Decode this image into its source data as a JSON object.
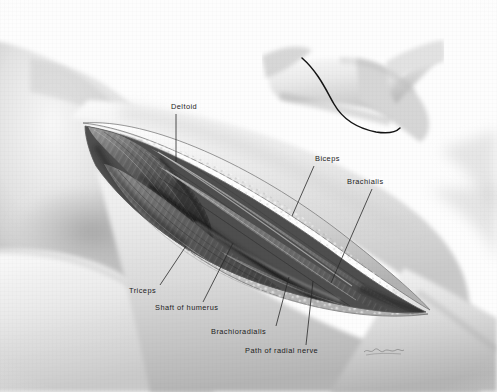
{
  "figure": {
    "medium": "grayscale anatomical wash drawing",
    "background_color": "#fdfdfd",
    "label_color": "#1c1c1c",
    "leader_color": "#2a2a2a"
  },
  "labels": [
    {
      "id": "deltoid",
      "text": "Deltoid",
      "x": 171,
      "y": 103,
      "leader": {
        "x1": 176,
        "y1": 114,
        "x2": 176,
        "y2": 162
      }
    },
    {
      "id": "biceps",
      "text": "Biceps",
      "x": 315,
      "y": 155,
      "leader": {
        "x1": 314,
        "y1": 166,
        "x2": 292,
        "y2": 216
      }
    },
    {
      "id": "brachialis",
      "text": "Brachialis",
      "x": 347,
      "y": 178,
      "leader": {
        "x1": 372,
        "y1": 189,
        "x2": 331,
        "y2": 283
      }
    },
    {
      "id": "triceps",
      "text": "Triceps",
      "x": 129,
      "y": 287,
      "leader": {
        "x1": 160,
        "y1": 285,
        "x2": 186,
        "y2": 246
      }
    },
    {
      "id": "shaft-of-humerus",
      "text": "Shaft of  humerus",
      "x": 155,
      "y": 304,
      "leader": {
        "x1": 203,
        "y1": 302,
        "x2": 233,
        "y2": 243
      }
    },
    {
      "id": "brachioradialis",
      "text": "Brachioradialis",
      "x": 211,
      "y": 328,
      "leader": {
        "x1": 276,
        "y1": 326,
        "x2": 289,
        "y2": 277
      }
    },
    {
      "id": "path-of-radial-nerve",
      "text": "Path of radial nerve",
      "x": 245,
      "y": 347,
      "leader": {
        "x1": 306,
        "y1": 345,
        "x2": 313,
        "y2": 281
      }
    }
  ],
  "inset": {
    "id": "arm-incision-inset",
    "description": "flexed arm showing skin incision line",
    "incision_line_color": "#141414"
  },
  "wound": {
    "id": "surgical-wound",
    "apex_proximal": {
      "x": 85,
      "y": 125
    },
    "apex_distal": {
      "x": 426,
      "y": 312
    },
    "structures": [
      "Deltoid",
      "Biceps",
      "Brachialis",
      "Triceps",
      "Brachioradialis"
    ]
  },
  "signature": {
    "id": "artist-signature",
    "text": "",
    "legible": false
  }
}
